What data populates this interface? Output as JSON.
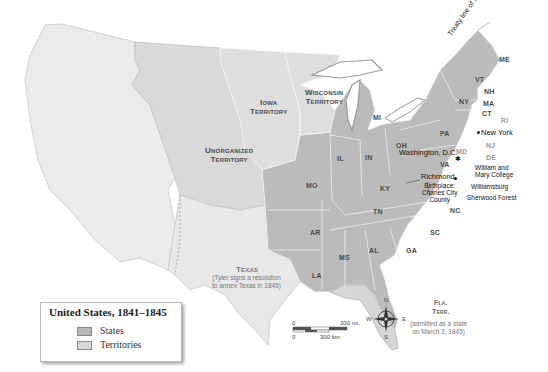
{
  "map": {
    "title": "United States, 1841–1845",
    "colors": {
      "states": "#b9b9b9",
      "territories": "#d8d8d8",
      "unorganized": "#e6e6e6",
      "water": "#ffffff"
    },
    "legend": {
      "title": "United States, 1841–1845",
      "items": [
        {
          "label": "States",
          "color": "#b9b9b9"
        },
        {
          "label": "Territories",
          "color": "#d8d8d8"
        }
      ]
    },
    "territories": [
      {
        "name": "Iowa\nTerritory",
        "line1": "Iowa",
        "line2": "Territory"
      },
      {
        "name": "Wisconsin Territory",
        "line1": "Wisconsin",
        "line2": "Territory"
      },
      {
        "name": "Unorganized Territory",
        "line1": "Unorganized",
        "line2": "Territory"
      },
      {
        "name": "Texas",
        "line1": "Texas",
        "note": "(Tyler signs a resolution to annex Texas in 1845)",
        "note1": "(Tyler signs a resolution",
        "note2": "to annex Texas in 1845)"
      },
      {
        "name": "Fla. Terr.",
        "line1": "Fla.",
        "line2": "Terr.",
        "note1": "(admitted as a state",
        "note2": "on March 3, 1845)"
      }
    ],
    "states": [
      "ME",
      "VT",
      "NH",
      "MA",
      "RI",
      "CT",
      "NY",
      "PA",
      "NJ",
      "DE",
      "MD",
      "VA",
      "NC",
      "SC",
      "GA",
      "AL",
      "MS",
      "LA",
      "AR",
      "MO",
      "TN",
      "KY",
      "OH",
      "IN",
      "IL",
      "MI"
    ],
    "cities": [
      {
        "name": "New York"
      },
      {
        "name": "Washington, D.C."
      },
      {
        "name": "Richmond"
      },
      {
        "name": "Williamsburg"
      },
      {
        "name": "Sherwood Forest"
      },
      {
        "name": "William and Mary College",
        "line1": "William and",
        "line2": "Mary College"
      },
      {
        "name": "Birthplace: Charles City County",
        "line1": "Birthplace:",
        "line2": "Charles City",
        "line3": "County"
      }
    ],
    "annotation": "Treaty line of 1842",
    "scale": {
      "miles": "300 mi.",
      "km": "300 km",
      "zero": "0"
    },
    "compass": {
      "n": "N",
      "s": "S",
      "e": "E",
      "w": "W"
    }
  }
}
